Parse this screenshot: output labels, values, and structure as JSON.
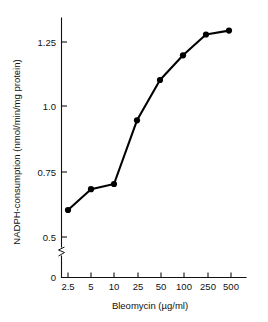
{
  "chart_data": {
    "type": "line",
    "title": "",
    "subtitle": "",
    "xlabel": "Bleomycin (µg/ml)",
    "ylabel": "NADPH-consumption (nmol/min/mg protein)",
    "categories": [
      "2.5",
      "5",
      "10",
      "25",
      "50",
      "100",
      "250",
      "500"
    ],
    "x": [
      2.5,
      5,
      10,
      25,
      50,
      100,
      250,
      500
    ],
    "values": [
      0.6,
      0.68,
      0.7,
      0.945,
      1.1,
      1.195,
      1.275,
      1.29
    ],
    "series": [
      {
        "name": "NADPH-consumption",
        "values": [
          0.6,
          0.68,
          0.7,
          0.945,
          1.1,
          1.195,
          1.275,
          1.29
        ]
      }
    ],
    "xticklabels": [
      "2.5",
      "5",
      "10",
      "25",
      "50",
      "100",
      "250",
      "500"
    ],
    "yticklabels": [
      "0",
      "0.5",
      "0.75",
      "1.0",
      "1.25"
    ],
    "ytickvalues": [
      0,
      0.5,
      0.75,
      1.0,
      1.25
    ],
    "ylim": [
      0,
      1.35
    ],
    "xscale": "log-categorical",
    "grid": false,
    "legend": "none",
    "axis_break": "y-axis break between 0 and 0.5",
    "marker": "filled-circle",
    "line_color": "#000000",
    "marker_color": "#000000"
  },
  "axes": {
    "y_title": "NADPH-consumption (nmol/min/mg protein)",
    "x_title": "Bleomycin (µg/ml)",
    "y_ticks": [
      {
        "label": "1.25",
        "value": 1.25
      },
      {
        "label": "1.0",
        "value": 1.0
      },
      {
        "label": "0.75",
        "value": 0.75
      },
      {
        "label": "0.5",
        "value": 0.5
      },
      {
        "label": "0",
        "value": 0
      }
    ],
    "x_ticks": [
      {
        "label": "2.5"
      },
      {
        "label": "5"
      },
      {
        "label": "10"
      },
      {
        "label": "25"
      },
      {
        "label": "50"
      },
      {
        "label": "100"
      },
      {
        "label": "250"
      },
      {
        "label": "500"
      }
    ]
  },
  "colors": {
    "background": "#ffffff",
    "ink": "#111111",
    "data": "#000000"
  }
}
